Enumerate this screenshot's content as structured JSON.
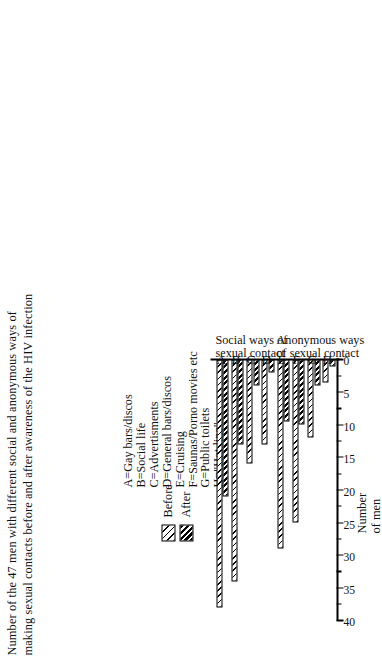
{
  "chart_data": {
    "type": "bar",
    "orientation": "horizontal",
    "title": "Number of the 47 men with different social and anonymous ways of making sexual contacts before and after awareness of the HIV infection",
    "title_line1": "Number of the 47 men with different social and anonymous ways of",
    "title_line2": "making sexual contacts before and after awareness of the HIV infection",
    "xlabel": "",
    "ylabel": "Number of men",
    "ylabel_line1": "Number",
    "ylabel_line2": "of men",
    "categories": [
      "A",
      "B",
      "C",
      "D",
      "E",
      "F",
      "G",
      "H"
    ],
    "series": [
      {
        "name": "Before",
        "values": [
          38,
          34,
          16,
          13,
          29,
          25,
          12,
          3.5
        ]
      },
      {
        "name": "After",
        "values": [
          21,
          13,
          4,
          2,
          9.5,
          10,
          4,
          1
        ]
      }
    ],
    "value_axis_range": [
      0,
      40
    ],
    "value_axis_ticks": [
      40,
      35,
      30,
      25,
      20,
      15,
      10,
      5,
      0
    ],
    "minor_ticks_every": 2.5,
    "grid": false,
    "legend_position": "top-left",
    "category_key": [
      "A=Gay bars/discos",
      "B=Social life",
      "C=Advertisments",
      "D=General bars/discos",
      "E=Cruising",
      "F=Saunas/Porno movies etc",
      "G=Public toilets",
      "H=\"Hot line\""
    ],
    "group_captions": [
      {
        "label_line1": "Social ways of",
        "label_line2": "sexual contact",
        "categories": [
          "A",
          "B",
          "C",
          "D"
        ]
      },
      {
        "label_line1": "Anonymous ways",
        "label_line2": "of sexual contact",
        "categories": [
          "E",
          "F",
          "G",
          "H"
        ]
      }
    ],
    "colors": {
      "before_fill": "#ffffff",
      "after_fill": "#ffffff",
      "ink": "#000000",
      "background": "#ffffff"
    }
  }
}
